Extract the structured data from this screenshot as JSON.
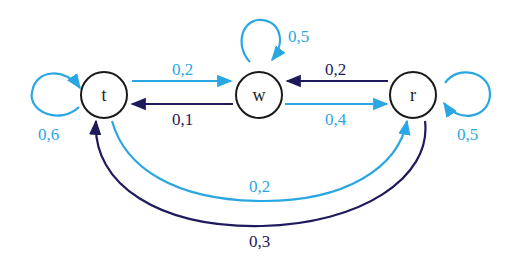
{
  "colors": {
    "light": "#2aa7e3",
    "dark": "#1e1a5c",
    "node_stroke": "#1a1a1a"
  },
  "nodes": [
    {
      "id": "t",
      "label": "t"
    },
    {
      "id": "w",
      "label": "w"
    },
    {
      "id": "r",
      "label": "r"
    }
  ],
  "edges": {
    "t_t": {
      "from": "t",
      "to": "t",
      "label": "0,6"
    },
    "w_w": {
      "from": "w",
      "to": "w",
      "label": "0,5"
    },
    "r_r": {
      "from": "r",
      "to": "r",
      "label": "0,5"
    },
    "t_w": {
      "from": "t",
      "to": "w",
      "label": "0,2"
    },
    "w_t": {
      "from": "w",
      "to": "t",
      "label": "0,1"
    },
    "r_w": {
      "from": "r",
      "to": "w",
      "label": "0,2"
    },
    "w_r": {
      "from": "w",
      "to": "r",
      "label": "0,4"
    },
    "t_r": {
      "from": "t",
      "to": "r",
      "label": "0,2"
    },
    "r_t": {
      "from": "r",
      "to": "t",
      "label": "0,3"
    }
  }
}
